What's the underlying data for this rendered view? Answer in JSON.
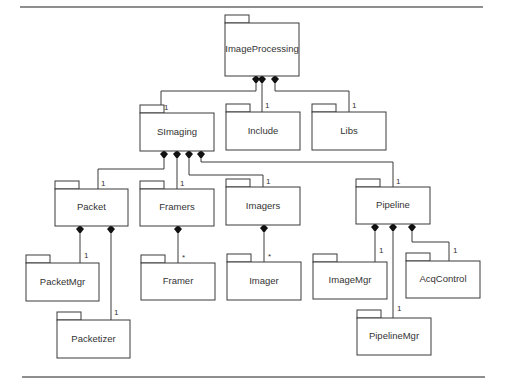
{
  "diagram": {
    "type": "UML package diagram",
    "packages": [
      {
        "id": "ImageProcessing",
        "label": "ImageProcessing",
        "x": 225,
        "y": 23,
        "w": 74,
        "h": 53
      },
      {
        "id": "SImaging",
        "label": "SImaging",
        "x": 140,
        "y": 113,
        "w": 74,
        "h": 38
      },
      {
        "id": "Include",
        "label": "Include",
        "x": 226,
        "y": 112,
        "w": 74,
        "h": 38
      },
      {
        "id": "Libs",
        "label": "Libs",
        "x": 312,
        "y": 112,
        "w": 74,
        "h": 38
      },
      {
        "id": "Packet",
        "label": "Packet",
        "x": 55,
        "y": 189,
        "w": 73,
        "h": 37
      },
      {
        "id": "Framers",
        "label": "Framers",
        "x": 140,
        "y": 189,
        "w": 74,
        "h": 37
      },
      {
        "id": "Imagers",
        "label": "Imagers",
        "x": 226,
        "y": 187,
        "w": 74,
        "h": 38
      },
      {
        "id": "Pipeline",
        "label": "Pipeline",
        "x": 356,
        "y": 187,
        "w": 74,
        "h": 37
      },
      {
        "id": "PacketMgr",
        "label": "PacketMgr",
        "x": 26,
        "y": 263,
        "w": 73,
        "h": 38
      },
      {
        "id": "Framer",
        "label": "Framer",
        "x": 141,
        "y": 263,
        "w": 74,
        "h": 37
      },
      {
        "id": "Imager",
        "label": "Imager",
        "x": 227,
        "y": 262,
        "w": 74,
        "h": 38
      },
      {
        "id": "ImageMgr",
        "label": "ImageMgr",
        "x": 313,
        "y": 262,
        "w": 74,
        "h": 37
      },
      {
        "id": "AcqControl",
        "label": "AcqControl",
        "x": 406,
        "y": 261,
        "w": 74,
        "h": 37
      },
      {
        "id": "Packetizer",
        "label": "Packetizer",
        "x": 57,
        "y": 320,
        "w": 73,
        "h": 38
      },
      {
        "id": "PipelineMgr",
        "label": "PipelineMgr",
        "x": 357,
        "y": 318,
        "w": 74,
        "h": 37
      }
    ],
    "compositions": [
      {
        "whole": "ImageProcessing",
        "part": "SImaging",
        "multiplicity": "1",
        "diamond": [
          256,
          79
        ],
        "path": [
          [
            256,
            84
          ],
          [
            256,
            91
          ],
          [
            161,
            91
          ],
          [
            161,
            113
          ]
        ],
        "label_pos": [
          164,
          110
        ]
      },
      {
        "whole": "ImageProcessing",
        "part": "Include",
        "multiplicity": "1",
        "diamond": [
          262,
          79
        ],
        "path": [
          [
            262,
            84
          ],
          [
            262,
            112
          ]
        ],
        "label_pos": [
          265,
          108
        ]
      },
      {
        "whole": "ImageProcessing",
        "part": "Libs",
        "multiplicity": "1",
        "diamond": [
          275,
          79
        ],
        "path": [
          [
            275,
            84
          ],
          [
            275,
            91
          ],
          [
            349,
            91
          ],
          [
            349,
            112
          ]
        ],
        "label_pos": [
          352,
          108
        ]
      },
      {
        "whole": "SImaging",
        "part": "Packet",
        "multiplicity": "1",
        "diamond": [
          164,
          154
        ],
        "path": [
          [
            164,
            159
          ],
          [
            164,
            169
          ],
          [
            98,
            169
          ],
          [
            98,
            189
          ]
        ],
        "label_pos": [
          101,
          186
        ]
      },
      {
        "whole": "SImaging",
        "part": "Framers",
        "multiplicity": "1",
        "diamond": [
          177,
          154
        ],
        "path": [
          [
            177,
            159
          ],
          [
            177,
            189
          ]
        ],
        "label_pos": [
          180,
          186
        ]
      },
      {
        "whole": "SImaging",
        "part": "Imagers",
        "multiplicity": "1",
        "diamond": [
          189,
          154
        ],
        "path": [
          [
            189,
            159
          ],
          [
            189,
            175
          ],
          [
            263,
            175
          ],
          [
            263,
            187
          ]
        ],
        "label_pos": [
          266,
          184
        ]
      },
      {
        "whole": "SImaging",
        "part": "Pipeline",
        "multiplicity": "1",
        "diamond": [
          201,
          154
        ],
        "path": [
          [
            201,
            159
          ],
          [
            201,
            162
          ],
          [
            393,
            162
          ],
          [
            393,
            187
          ]
        ],
        "label_pos": [
          396,
          184
        ]
      },
      {
        "whole": "Packet",
        "part": "PacketMgr",
        "multiplicity": "1",
        "diamond": [
          80,
          229
        ],
        "path": [
          [
            80,
            234
          ],
          [
            80,
            263
          ]
        ],
        "label_pos": [
          84,
          258
        ]
      },
      {
        "whole": "Packet",
        "part": "Packetizer",
        "multiplicity": "1",
        "diamond": [
          111,
          229
        ],
        "path": [
          [
            111,
            234
          ],
          [
            111,
            320
          ]
        ],
        "label_pos": [
          114,
          315
        ]
      },
      {
        "whole": "Framers",
        "part": "Framer",
        "multiplicity": "*",
        "diamond": [
          178,
          229
        ],
        "path": [
          [
            178,
            234
          ],
          [
            178,
            263
          ]
        ],
        "label_pos": [
          182,
          260
        ]
      },
      {
        "whole": "Imagers",
        "part": "Imager",
        "multiplicity": "*",
        "diamond": [
          264,
          228
        ],
        "path": [
          [
            264,
            233
          ],
          [
            264,
            262
          ]
        ],
        "label_pos": [
          268,
          259
        ]
      },
      {
        "whole": "Pipeline",
        "part": "ImageMgr",
        "multiplicity": "1",
        "diamond": [
          375,
          227
        ],
        "path": [
          [
            375,
            232
          ],
          [
            375,
            262
          ]
        ],
        "label_pos": [
          379,
          253
        ]
      },
      {
        "whole": "Pipeline",
        "part": "PipelineMgr",
        "multiplicity": "1",
        "diamond": [
          393,
          227
        ],
        "path": [
          [
            393,
            232
          ],
          [
            393,
            318
          ]
        ],
        "label_pos": [
          397,
          311
        ]
      },
      {
        "whole": "Pipeline",
        "part": "AcqControl",
        "multiplicity": "1",
        "diamond": [
          412,
          227
        ],
        "path": [
          [
            412,
            232
          ],
          [
            412,
            242
          ],
          [
            449,
            242
          ],
          [
            449,
            261
          ]
        ],
        "label_pos": [
          453,
          253
        ]
      }
    ],
    "rules": [
      {
        "x1": 20,
        "y1": 7,
        "x2": 483,
        "y2": 7
      },
      {
        "x1": 22,
        "y1": 377,
        "x2": 485,
        "y2": 377
      }
    ]
  }
}
